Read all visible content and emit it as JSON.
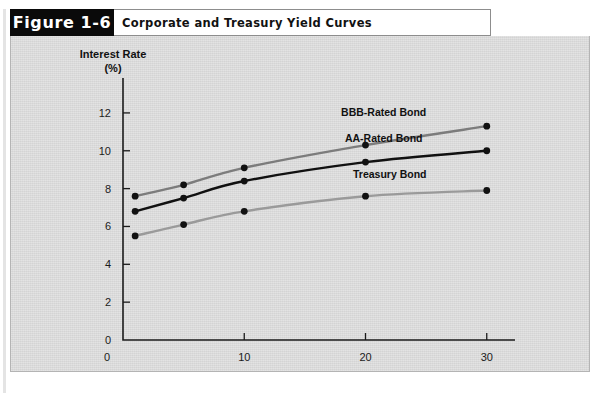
{
  "figure": {
    "tag": "Figure 1-6",
    "title": "Corporate and Treasury Yield Curves"
  },
  "colors": {
    "panel_background": "#d9d9d9",
    "tag_background": "#0a0a0a",
    "tag_text": "#ffffff",
    "axis": "#1b1b1b",
    "bbb_series": "#7c7c7c",
    "aa_series": "#111111",
    "treasury_series": "#9a9a9a"
  },
  "chart_data": {
    "type": "line",
    "title": "Corporate and Treasury Yield Curves",
    "xlabel": "Years to Maturity",
    "ylabel": "Interest Rate (%)",
    "ylabel_line1": "Interest Rate",
    "ylabel_line2": "(%)",
    "xlim": [
      0,
      32
    ],
    "ylim": [
      0,
      13
    ],
    "xticks": [
      0,
      10,
      20,
      30
    ],
    "xticklabels": [
      "0",
      "10",
      "20",
      "30"
    ],
    "yticks": [
      0,
      2,
      4,
      6,
      8,
      10,
      12
    ],
    "yticklabels": [
      "0",
      "2",
      "4",
      "6",
      "8",
      "10",
      "12"
    ],
    "grid": false,
    "legend_position": "inline-right",
    "x": [
      1,
      5,
      10,
      20,
      30
    ],
    "series": [
      {
        "name": "BBB-Rated Bond",
        "color": "#7c7c7c",
        "values": [
          7.6,
          8.2,
          9.1,
          10.3,
          11.3
        ],
        "label_x": 21.5,
        "label_y": 11.85
      },
      {
        "name": "AA-Rated Bond",
        "color": "#111111",
        "values": [
          6.8,
          7.5,
          8.4,
          9.4,
          10.0
        ],
        "label_x": 21.5,
        "label_y": 10.45
      },
      {
        "name": "Treasury Bond",
        "color": "#9a9a9a",
        "values": [
          5.5,
          6.1,
          6.8,
          7.6,
          7.9
        ],
        "label_x": 22.0,
        "label_y": 8.55
      }
    ]
  }
}
